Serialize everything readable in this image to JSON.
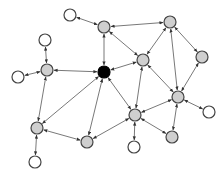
{
  "diagram": {
    "type": "network-graph",
    "width": 223,
    "height": 175,
    "colors": {
      "background": "#ffffff",
      "edge": "#555555",
      "node_stroke": "#444444",
      "hub_fill": "#000000",
      "gray_fill": "#cfcfcf",
      "leaf_fill": "#ffffff"
    },
    "nodes": [
      {
        "id": "W1",
        "x": 70,
        "y": 15,
        "kind": "leaf"
      },
      {
        "id": "G1",
        "x": 104,
        "y": 27,
        "kind": "gray"
      },
      {
        "id": "G2",
        "x": 170,
        "y": 22,
        "kind": "gray"
      },
      {
        "id": "W2",
        "x": 45,
        "y": 40,
        "kind": "leaf"
      },
      {
        "id": "G3",
        "x": 47,
        "y": 70,
        "kind": "gray"
      },
      {
        "id": "W3",
        "x": 18,
        "y": 77,
        "kind": "leaf"
      },
      {
        "id": "HUB",
        "x": 104,
        "y": 72,
        "kind": "hub"
      },
      {
        "id": "G4",
        "x": 143,
        "y": 60,
        "kind": "gray"
      },
      {
        "id": "G5",
        "x": 202,
        "y": 57,
        "kind": "gray"
      },
      {
        "id": "G9",
        "x": 178,
        "y": 97,
        "kind": "gray"
      },
      {
        "id": "W4",
        "x": 209,
        "y": 112,
        "kind": "leaf"
      },
      {
        "id": "G6",
        "x": 37,
        "y": 128,
        "kind": "gray"
      },
      {
        "id": "G7",
        "x": 87,
        "y": 142,
        "kind": "gray"
      },
      {
        "id": "G8",
        "x": 135,
        "y": 115,
        "kind": "gray"
      },
      {
        "id": "G10",
        "x": 172,
        "y": 137,
        "kind": "gray"
      },
      {
        "id": "W5",
        "x": 134,
        "y": 147,
        "kind": "leaf"
      },
      {
        "id": "W6",
        "x": 35,
        "y": 162,
        "kind": "leaf"
      }
    ],
    "edges": [
      [
        "W1",
        "G1"
      ],
      [
        "G1",
        "HUB"
      ],
      [
        "G1",
        "G2"
      ],
      [
        "G1",
        "G4"
      ],
      [
        "G2",
        "G4"
      ],
      [
        "G2",
        "G9"
      ],
      [
        "G2",
        "G5"
      ],
      [
        "W2",
        "G3"
      ],
      [
        "W3",
        "G3"
      ],
      [
        "G3",
        "HUB"
      ],
      [
        "G3",
        "G6"
      ],
      [
        "HUB",
        "G4"
      ],
      [
        "HUB",
        "G6"
      ],
      [
        "HUB",
        "G7"
      ],
      [
        "HUB",
        "G8"
      ],
      [
        "G4",
        "G8"
      ],
      [
        "G4",
        "G9"
      ],
      [
        "G5",
        "G9"
      ],
      [
        "G9",
        "W4"
      ],
      [
        "G9",
        "G8"
      ],
      [
        "G9",
        "G10"
      ],
      [
        "G8",
        "G10"
      ],
      [
        "G8",
        "W5"
      ],
      [
        "G8",
        "G7"
      ],
      [
        "G6",
        "G7"
      ],
      [
        "G6",
        "W6"
      ]
    ],
    "node_radius": 6
  }
}
